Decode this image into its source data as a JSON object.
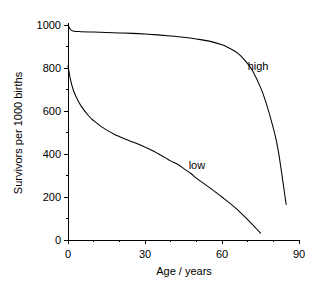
{
  "chart_data": {
    "type": "line",
    "title": "",
    "xlabel": "Age / years",
    "ylabel": "Survivors per 1000 births",
    "xlim": [
      0,
      90
    ],
    "ylim": [
      0,
      1000
    ],
    "x_ticks": [
      0,
      30,
      60,
      90
    ],
    "x_tick_labels": [
      "0",
      "30",
      "60",
      "90"
    ],
    "x_minor_step": 10,
    "y_ticks": [
      0,
      200,
      400,
      600,
      800,
      1000
    ],
    "y_tick_labels": [
      "0",
      "200",
      "400",
      "600",
      "800",
      "1000"
    ],
    "y_minor_step": 100,
    "grid": false,
    "legend": "inline-annotations",
    "series": [
      {
        "name": "high",
        "label": "high",
        "label_x": 70,
        "label_y": 810,
        "x": [
          0,
          1,
          2,
          3,
          5,
          10,
          15,
          20,
          25,
          30,
          35,
          40,
          45,
          50,
          55,
          60,
          62,
          65,
          67,
          70,
          72,
          75,
          77,
          80,
          82,
          85
        ],
        "y": [
          1000,
          978,
          972,
          970,
          969,
          967,
          965,
          963,
          961,
          958,
          954,
          949,
          943,
          935,
          925,
          908,
          898,
          878,
          860,
          820,
          785,
          710,
          645,
          520,
          410,
          165
        ]
      },
      {
        "name": "low",
        "label": "low",
        "label_x": 47,
        "label_y": 350,
        "x": [
          0,
          1,
          2,
          3,
          5,
          8,
          10,
          13,
          15,
          18,
          20,
          23,
          25,
          28,
          30,
          33,
          35,
          38,
          40,
          43,
          45,
          48,
          50,
          55,
          60,
          65,
          70,
          73,
          75
        ],
        "y": [
          810,
          745,
          700,
          670,
          625,
          578,
          555,
          527,
          512,
          492,
          481,
          466,
          457,
          443,
          432,
          415,
          402,
          382,
          368,
          350,
          333,
          308,
          288,
          245,
          200,
          152,
          95,
          58,
          32
        ]
      }
    ]
  },
  "geometry": {
    "plot_left": 68,
    "plot_right": 299,
    "plot_top": 25,
    "plot_bottom": 240
  }
}
